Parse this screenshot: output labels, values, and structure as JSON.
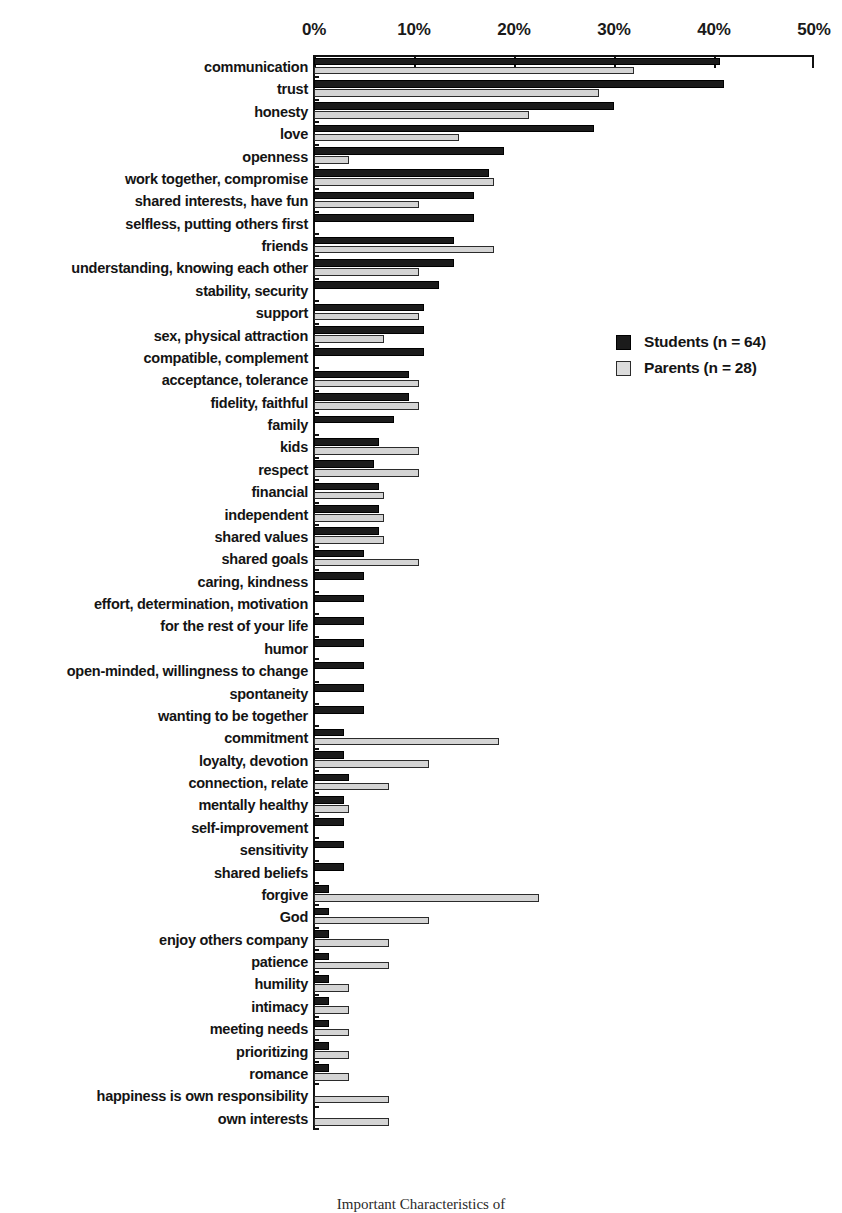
{
  "chart_data": {
    "type": "bar",
    "orientation": "horizontal",
    "title": "",
    "subtitle": "",
    "xlabel": "",
    "ylabel": "",
    "xlim": [
      0,
      50
    ],
    "xticks": [
      0,
      10,
      20,
      30,
      40,
      50
    ],
    "xtick_labels": [
      "0%",
      "10%",
      "20%",
      "30%",
      "40%",
      "50%"
    ],
    "grid": false,
    "legend_position": "center-right",
    "categories": [
      "communication",
      "trust",
      "honesty",
      "love",
      "openness",
      "work together, compromise",
      "shared interests, have fun",
      "selfless, putting others first",
      "friends",
      "understanding, knowing each other",
      "stability, security",
      "support",
      "sex, physical attraction",
      "compatible, complement",
      "acceptance, tolerance",
      "fidelity, faithful",
      "family",
      "kids",
      "respect",
      "financial",
      "independent",
      "shared values",
      "shared goals",
      "caring, kindness",
      "effort, determination, motivation",
      "for the rest of your life",
      "humor",
      "open-minded, willingness to change",
      "spontaneity",
      "wanting to be together",
      "commitment",
      "loyalty, devotion",
      "connection, relate",
      "mentally healthy",
      "self-improvement",
      "sensitivity",
      "shared beliefs",
      "forgive",
      "God",
      "enjoy others company",
      "patience",
      "humility",
      "intimacy",
      "meeting needs",
      "prioritizing",
      "romance",
      "happiness is own responsibility",
      "own interests"
    ],
    "series": [
      {
        "name": "Students (n = 64)",
        "color": "#1b1b1b",
        "values": [
          40.6,
          41.0,
          30.0,
          28.0,
          19.0,
          17.5,
          16.0,
          16.0,
          14.0,
          14.0,
          12.5,
          11.0,
          11.0,
          11.0,
          9.5,
          9.5,
          8.0,
          6.5,
          6.0,
          6.5,
          6.5,
          6.5,
          5.0,
          5.0,
          5.0,
          5.0,
          5.0,
          5.0,
          5.0,
          5.0,
          3.0,
          3.0,
          3.5,
          3.0,
          3.0,
          3.0,
          3.0,
          1.5,
          1.5,
          1.5,
          1.5,
          1.5,
          1.5,
          1.5,
          1.5,
          1.5,
          0.0,
          0.0
        ]
      },
      {
        "name": "Parents (n = 28)",
        "color": "#d4d4d4",
        "values": [
          32.0,
          28.5,
          21.5,
          14.5,
          3.5,
          18.0,
          10.5,
          0.0,
          18.0,
          10.5,
          0.0,
          10.5,
          7.0,
          0.0,
          10.5,
          10.5,
          0.0,
          10.5,
          10.5,
          7.0,
          7.0,
          7.0,
          10.5,
          0.0,
          0.0,
          0.0,
          0.0,
          0.0,
          0.0,
          0.0,
          18.5,
          11.5,
          7.5,
          3.5,
          0.0,
          0.0,
          0.0,
          22.5,
          11.5,
          7.5,
          7.5,
          3.5,
          3.5,
          3.5,
          3.5,
          3.5,
          7.5,
          7.5
        ]
      }
    ]
  },
  "legend": {
    "entries": [
      {
        "label": "Students (n = 64)",
        "swatch": "students"
      },
      {
        "label": "Parents (n = 28)",
        "swatch": "parents"
      }
    ]
  },
  "caption": "Important Characteristics of"
}
